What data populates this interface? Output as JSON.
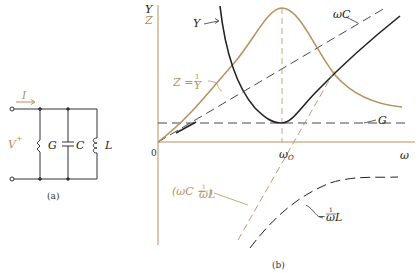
{
  "circuit": {
    "current_label": "I",
    "voltage_label": "V",
    "voltage_polarity": "+",
    "elements": [
      "G",
      "C",
      "L"
    ],
    "caption": "(a)"
  },
  "graph": {
    "caption": "(b)",
    "y_axis_labels": [
      "Y",
      "Z"
    ],
    "x_axis_label": "ω",
    "origin_label": "0",
    "resonance_label": "ω",
    "resonance_subscript": "O",
    "curves": {
      "Y": "Y",
      "Z_lhs": "Z =",
      "Z_num": "1",
      "Z_den": "Y",
      "wC": "ωC",
      "G": "G",
      "diff_open": "(ωC −",
      "diff_num": "1",
      "diff_den": "ωL",
      "diff_close": ")",
      "invL_num": "1",
      "invL_prefix": "−",
      "invL_den": "ωL"
    }
  },
  "colors": {
    "tan": "#b8905e",
    "black": "#222222"
  }
}
